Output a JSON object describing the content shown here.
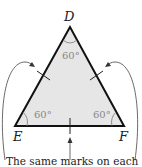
{
  "diagram": {
    "type": "equilateral-triangle",
    "vertices": {
      "top": "D",
      "bottom_left": "E",
      "bottom_right": "F"
    },
    "angles": {
      "D": "60°",
      "E": "60°",
      "F": "60°"
    },
    "caption": "The same marks on each side",
    "colors": {
      "fill": "#e6e6e6",
      "stroke": "#111111",
      "angle_text": "#888888"
    }
  }
}
